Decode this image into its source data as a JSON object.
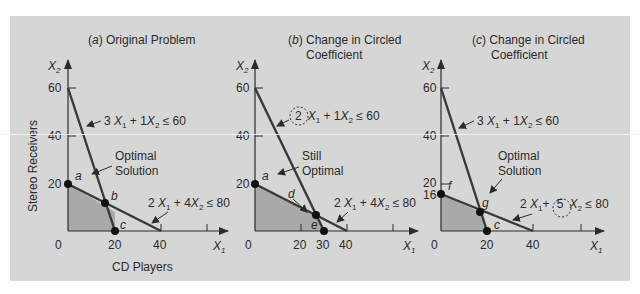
{
  "figure": {
    "y_axis_title": "Stereo Receivers",
    "x_axis_title": "CD Players",
    "x_axis_symbol": "X",
    "x_axis_sub": "1",
    "y_axis_symbol": "X",
    "y_axis_sub": "2",
    "colors": {
      "background": "#d6d6d6",
      "feasible_region": "#a9a9a9",
      "lines": "#3a3a3a",
      "points": "#111111"
    }
  },
  "panels": [
    {
      "id": "a",
      "letter": "a",
      "title_line1": "Original Problem",
      "title_line2": "",
      "y_ticks": [
        "60",
        "40",
        "20"
      ],
      "x_ticks": [
        "0",
        "20",
        "40"
      ],
      "constraint1": {
        "c1": "3",
        "c2": "1",
        "rhs": "60",
        "circled": ""
      },
      "constraint2": {
        "c1": "2",
        "c2": "4",
        "rhs": "80",
        "circled": ""
      },
      "annotation_line1": "Optimal",
      "annotation_line2": "Solution",
      "points": [
        {
          "label": "a",
          "x": 0,
          "y": 20
        },
        {
          "label": "b",
          "x": 16,
          "y": 12
        },
        {
          "label": "c",
          "x": 20,
          "y": 0
        }
      ]
    },
    {
      "id": "b",
      "letter": "b",
      "title_line1": "Change in Circled",
      "title_line2": "Coefficient",
      "y_ticks": [
        "60",
        "40",
        "20"
      ],
      "x_ticks": [
        "0",
        "20",
        "30",
        "40"
      ],
      "constraint1": {
        "c1": "2",
        "c2": "1",
        "rhs": "60",
        "circled": "c1"
      },
      "constraint2": {
        "c1": "2",
        "c2": "4",
        "rhs": "80",
        "circled": ""
      },
      "annotation_line1": "Still",
      "annotation_line2": "Optimal",
      "points": [
        {
          "label": "a",
          "x": 0,
          "y": 20
        },
        {
          "label": "d",
          "x": 26.7,
          "y": 6.7
        },
        {
          "label": "e",
          "x": 30,
          "y": 0
        }
      ]
    },
    {
      "id": "c",
      "letter": "c",
      "title_line1": "Change in Circled",
      "title_line2": "Coefficient",
      "y_ticks": [
        "60",
        "40",
        "20",
        "16"
      ],
      "x_ticks": [
        "0",
        "20",
        "40"
      ],
      "constraint1": {
        "c1": "3",
        "c2": "1",
        "rhs": "60",
        "circled": ""
      },
      "constraint2": {
        "c1": "2",
        "c2": "5",
        "rhs": "80",
        "circled": "c2"
      },
      "annotation_line1": "Optimal",
      "annotation_line2": "Solution",
      "points": [
        {
          "label": "f",
          "x": 0,
          "y": 16
        },
        {
          "label": "g",
          "x": 17.1,
          "y": 8.6
        },
        {
          "label": "c",
          "x": 20,
          "y": 0
        }
      ]
    }
  ]
}
